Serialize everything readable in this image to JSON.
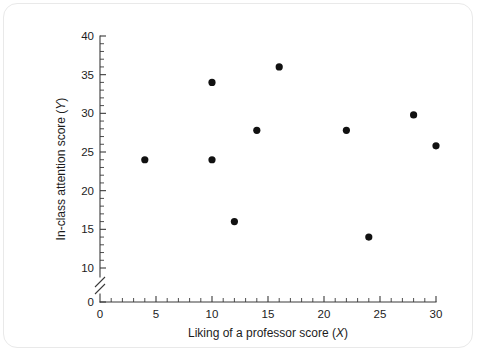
{
  "chart_data": {
    "type": "scatter",
    "title": "",
    "xlabel": "Liking of a professor score (X)",
    "ylabel": "In-class attention score (Y)",
    "xlabel_text": "Liking of a professor score",
    "xlabel_var": "X",
    "ylabel_text": "In-class attention score",
    "ylabel_var": "Y",
    "xlim": [
      0,
      30
    ],
    "ylim": [
      0,
      40
    ],
    "y_axis_break": true,
    "y_break_between": [
      0,
      10
    ],
    "grid": false,
    "legend": null,
    "x_major_ticks": [
      0,
      5,
      10,
      15,
      20,
      25,
      30
    ],
    "x_tick_labels": [
      "0",
      "5",
      "10",
      "15",
      "20",
      "25",
      "30"
    ],
    "x_minor_tick_step": 1,
    "y_major_ticks": [
      0,
      10,
      15,
      20,
      25,
      30,
      35,
      40
    ],
    "y_tick_labels": [
      "0",
      "10",
      "15",
      "20",
      "25",
      "30",
      "35",
      "40"
    ],
    "y_minor_tick_step": 1,
    "marker": "filled-circle",
    "marker_color": "#111111",
    "points": [
      {
        "x": 4,
        "y": 24
      },
      {
        "x": 10,
        "y": 34
      },
      {
        "x": 10,
        "y": 24
      },
      {
        "x": 12,
        "y": 16
      },
      {
        "x": 14,
        "y": 27.8
      },
      {
        "x": 16,
        "y": 36
      },
      {
        "x": 22,
        "y": 27.8
      },
      {
        "x": 24,
        "y": 14
      },
      {
        "x": 28,
        "y": 29.8
      },
      {
        "x": 30,
        "y": 25.8
      }
    ]
  },
  "colors": {
    "axis": "#3a3a3a",
    "text": "#1c1c1c",
    "marker": "#111111",
    "background": "#ffffff",
    "frame": "#e9e9e9"
  }
}
